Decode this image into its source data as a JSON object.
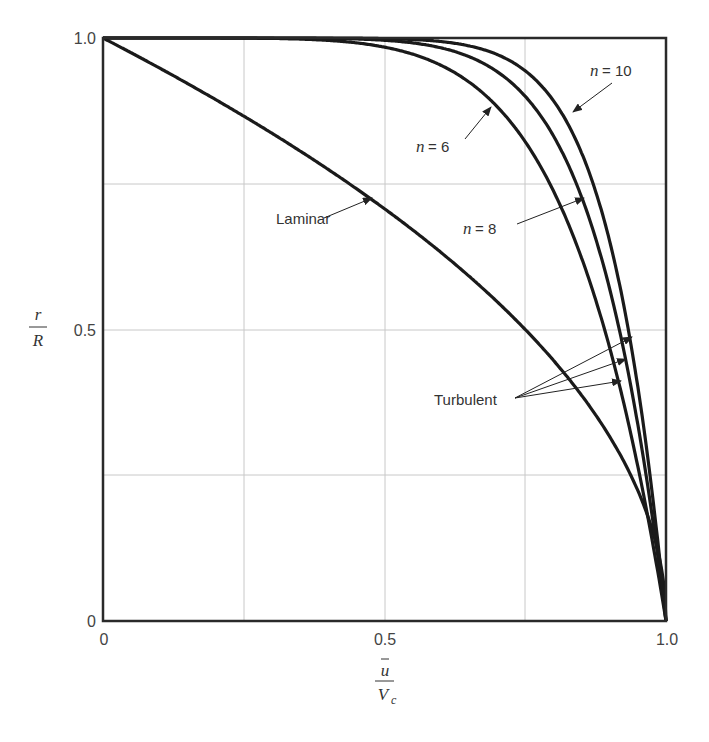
{
  "chart_data": {
    "type": "line",
    "title": "",
    "xlabel": "ū / V_c",
    "ylabel": "r / R",
    "xlim": [
      0,
      1.0
    ],
    "ylim": [
      0,
      1.0
    ],
    "grid": true,
    "x_ticks": [
      "0",
      "0.5",
      "1.0"
    ],
    "y_ticks": [
      "0",
      "0.5",
      "1.0"
    ],
    "series": [
      {
        "name": "Laminar",
        "formula": "r/R = sqrt(1 - u/Vc)",
        "x": [
          0,
          0.1,
          0.2,
          0.3,
          0.4,
          0.5,
          0.6,
          0.7,
          0.8,
          0.9,
          0.95,
          1.0
        ],
        "y": [
          1.0,
          0.949,
          0.894,
          0.837,
          0.775,
          0.707,
          0.632,
          0.548,
          0.447,
          0.316,
          0.224,
          0
        ]
      },
      {
        "name": "Turbulent n = 6",
        "formula": "r/R = 1 - (u/Vc)^6",
        "x": [
          0,
          0.5,
          0.6,
          0.7,
          0.8,
          0.85,
          0.9,
          0.95,
          1.0
        ],
        "y": [
          1.0,
          0.984,
          0.953,
          0.882,
          0.738,
          0.623,
          0.469,
          0.265,
          0
        ]
      },
      {
        "name": "Turbulent n = 8",
        "formula": "r/R = 1 - (u/Vc)^8",
        "x": [
          0,
          0.5,
          0.6,
          0.7,
          0.8,
          0.85,
          0.9,
          0.95,
          1.0
        ],
        "y": [
          1.0,
          0.996,
          0.983,
          0.942,
          0.832,
          0.728,
          0.57,
          0.337,
          0
        ]
      },
      {
        "name": "Turbulent n = 10",
        "formula": "r/R = 1 - (u/Vc)^10",
        "x": [
          0,
          0.5,
          0.6,
          0.7,
          0.8,
          0.85,
          0.9,
          0.95,
          1.0
        ],
        "y": [
          1.0,
          0.999,
          0.994,
          0.972,
          0.893,
          0.803,
          0.651,
          0.401,
          0
        ]
      }
    ],
    "annotations": [
      "Laminar",
      "n = 6",
      "n = 8",
      "n = 10",
      "Turbulent"
    ]
  },
  "labels": {
    "y_axis_num": "r",
    "y_axis_den": "R",
    "x_axis_num": "u",
    "x_axis_den": "V",
    "x_axis_den_sub": "c",
    "tick_x0": "0",
    "tick_x05": "0.5",
    "tick_x1": "1.0",
    "tick_y0": "0",
    "tick_y05": "0.5",
    "tick_y1": "1.0",
    "laminar": "Laminar",
    "n6": "= 6",
    "n8": "= 8",
    "n10": "= 10",
    "n_var": "n",
    "turbulent": "Turbulent"
  }
}
